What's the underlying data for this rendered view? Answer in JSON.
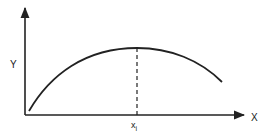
{
  "diagram": {
    "type": "curve-with-maximum",
    "axes": {
      "x_label": "X",
      "y_label": "Y"
    },
    "marker": {
      "label_main": "x",
      "label_sub": "i",
      "description": "dashed vertical line at curve maximum"
    },
    "colors": {
      "line": "#222222",
      "background": "#ffffff"
    }
  }
}
